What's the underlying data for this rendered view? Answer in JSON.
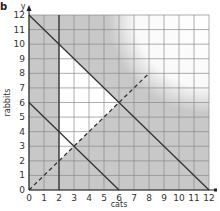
{
  "panel_label": "b",
  "chart_data": {
    "type": "line",
    "title": "",
    "xlabel": "cats",
    "ylabel": "rabbits",
    "x_axis_symbol": "x",
    "y_axis_symbol": "y",
    "xlim": [
      0,
      12
    ],
    "ylim": [
      0,
      12
    ],
    "grid": true,
    "x_ticks": [
      "0",
      "1",
      "2",
      "3",
      "4",
      "5",
      "6",
      "7",
      "8",
      "9",
      "10",
      "11",
      "12"
    ],
    "y_ticks": [
      "0",
      "1",
      "2",
      "3",
      "4",
      "5",
      "6",
      "7",
      "8",
      "9",
      "10",
      "11",
      "12"
    ],
    "series": [
      {
        "name": "x + y = 12",
        "style": "solid",
        "points": [
          [
            0,
            12
          ],
          [
            12,
            0
          ]
        ]
      },
      {
        "name": "x + y = 6",
        "style": "solid",
        "points": [
          [
            0,
            6
          ],
          [
            6,
            0
          ]
        ]
      },
      {
        "name": "x = 2",
        "style": "solid",
        "points": [
          [
            2,
            0
          ],
          [
            2,
            12
          ]
        ]
      },
      {
        "name": "y = x",
        "style": "dashed",
        "points": [
          [
            0,
            0
          ],
          [
            8,
            8
          ]
        ]
      }
    ],
    "feasible_region": {
      "description": "unshaded region",
      "vertices": [
        [
          2,
          10
        ],
        [
          6,
          6
        ],
        [
          2,
          2
        ]
      ]
    },
    "colors": {
      "shade": "#c8c8c8",
      "grid": "#8a8a8a",
      "line": "#333333",
      "background": "#ffffff"
    }
  }
}
